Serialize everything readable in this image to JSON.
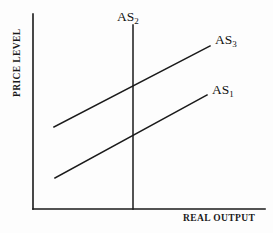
{
  "figure": {
    "type": "economics-diagram",
    "background_color": "#fdfdfd",
    "line_color": "#1a1a1a"
  },
  "axes": {
    "y_label": "PRICE LEVEL",
    "x_label": "REAL OUTPUT"
  },
  "curves": {
    "as2": {
      "label": "AS",
      "subscript": "2"
    },
    "as3": {
      "label": "AS",
      "subscript": "3"
    },
    "as1": {
      "label": "AS",
      "subscript": "1"
    }
  },
  "chart_data": {
    "type": "line",
    "title": "",
    "xlabel": "REAL OUTPUT",
    "ylabel": "PRICE LEVEL",
    "grid": false,
    "legend": "inline-labels",
    "axis_lines": {
      "y_axis": {
        "x": 33,
        "y_top": 14,
        "y_bottom": 209
      },
      "x_axis": {
        "y": 209,
        "x_left": 33,
        "x_right": 265
      }
    },
    "series": [
      {
        "name": "AS2",
        "style": "vertical",
        "points": [
          {
            "x": 133,
            "y": 25
          },
          {
            "x": 133,
            "y": 209
          }
        ],
        "label_position": {
          "x": 117,
          "y": 10
        }
      },
      {
        "name": "AS3",
        "style": "upward-sloping",
        "points": [
          {
            "x": 54,
            "y": 127
          },
          {
            "x": 210,
            "y": 46
          }
        ],
        "label_position": {
          "x": 215,
          "y": 33
        },
        "intersection_with_as2": {
          "x": 133,
          "y": 88
        }
      },
      {
        "name": "AS1",
        "style": "upward-sloping",
        "points": [
          {
            "x": 55,
            "y": 178
          },
          {
            "x": 207,
            "y": 95
          }
        ],
        "label_position": {
          "x": 212,
          "y": 83
        },
        "intersection_with_as2": {
          "x": 133,
          "y": 136
        }
      }
    ]
  }
}
